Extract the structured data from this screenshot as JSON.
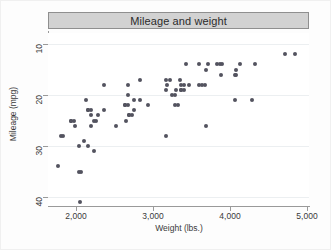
{
  "chart_data": {
    "type": "scatter",
    "title": "Mileage and weight",
    "xlabel": "Weight (lbs.)",
    "ylabel": "Mileage (mpg)",
    "xlim": [
      1700,
      5000
    ],
    "ylim": [
      10,
      42
    ],
    "xticks": [
      2000,
      3000,
      4000,
      5000
    ],
    "xtick_labels": [
      "2,000",
      "3,000",
      "4,000",
      "5,000"
    ],
    "yticks": [
      10,
      20,
      30,
      40
    ],
    "ytick_labels": [
      "10",
      "20",
      "30",
      "40"
    ],
    "grid": "horizontal",
    "legend": "none",
    "marker_color": "#53535f",
    "title_bar_color": "#d2d2d2",
    "points": [
      {
        "x": 2930,
        "y": 22
      },
      {
        "x": 3350,
        "y": 17
      },
      {
        "x": 2640,
        "y": 22
      },
      {
        "x": 3250,
        "y": 20
      },
      {
        "x": 4080,
        "y": 15
      },
      {
        "x": 3670,
        "y": 18
      },
      {
        "x": 3690,
        "y": 26
      },
      {
        "x": 3280,
        "y": 20
      },
      {
        "x": 3880,
        "y": 16
      },
      {
        "x": 3400,
        "y": 19
      },
      {
        "x": 4330,
        "y": 14
      },
      {
        "x": 3900,
        "y": 14
      },
      {
        "x": 4290,
        "y": 21
      },
      {
        "x": 3870,
        "y": 14
      },
      {
        "x": 2110,
        "y": 29
      },
      {
        "x": 2200,
        "y": 23
      },
      {
        "x": 2670,
        "y": 20
      },
      {
        "x": 3690,
        "y": 15
      },
      {
        "x": 3180,
        "y": 18
      },
      {
        "x": 3220,
        "y": 17
      },
      {
        "x": 4060,
        "y": 21
      },
      {
        "x": 3720,
        "y": 14
      },
      {
        "x": 3370,
        "y": 19
      },
      {
        "x": 3600,
        "y": 14
      },
      {
        "x": 4130,
        "y": 14
      },
      {
        "x": 2830,
        "y": 21
      },
      {
        "x": 3370,
        "y": 19
      },
      {
        "x": 4080,
        "y": 16
      },
      {
        "x": 4060,
        "y": 16
      },
      {
        "x": 3640,
        "y": 18
      },
      {
        "x": 2690,
        "y": 24
      },
      {
        "x": 3470,
        "y": 18
      },
      {
        "x": 3170,
        "y": 17
      },
      {
        "x": 3430,
        "y": 14
      },
      {
        "x": 4720,
        "y": 12
      },
      {
        "x": 3830,
        "y": 14
      },
      {
        "x": 4840,
        "y": 12
      },
      {
        "x": 3370,
        "y": 18
      },
      {
        "x": 2730,
        "y": 24
      },
      {
        "x": 2370,
        "y": 23
      },
      {
        "x": 2280,
        "y": 24
      },
      {
        "x": 2750,
        "y": 23
      },
      {
        "x": 2130,
        "y": 21
      },
      {
        "x": 2650,
        "y": 25
      },
      {
        "x": 3600,
        "y": 18
      },
      {
        "x": 3330,
        "y": 22
      },
      {
        "x": 2260,
        "y": 25
      },
      {
        "x": 1800,
        "y": 28
      },
      {
        "x": 2230,
        "y": 25
      },
      {
        "x": 1930,
        "y": 25
      },
      {
        "x": 1990,
        "y": 26
      },
      {
        "x": 2040,
        "y": 35
      },
      {
        "x": 2520,
        "y": 26
      },
      {
        "x": 3170,
        "y": 28
      },
      {
        "x": 2670,
        "y": 22
      },
      {
        "x": 1760,
        "y": 34
      },
      {
        "x": 2050,
        "y": 41
      },
      {
        "x": 1830,
        "y": 28
      },
      {
        "x": 2160,
        "y": 30
      },
      {
        "x": 2040,
        "y": 30
      },
      {
        "x": 2240,
        "y": 31
      },
      {
        "x": 2370,
        "y": 18
      },
      {
        "x": 2190,
        "y": 24
      },
      {
        "x": 2200,
        "y": 26
      },
      {
        "x": 2150,
        "y": 23
      },
      {
        "x": 2070,
        "y": 35
      },
      {
        "x": 1930,
        "y": 25
      },
      {
        "x": 1980,
        "y": 25
      },
      {
        "x": 2670,
        "y": 18
      },
      {
        "x": 2160,
        "y": 23
      },
      {
        "x": 2750,
        "y": 21
      },
      {
        "x": 2830,
        "y": 17
      },
      {
        "x": 3170,
        "y": 19
      },
      {
        "x": 2640,
        "y": 22
      },
      {
        "x": 3290,
        "y": 22
      },
      {
        "x": 2690,
        "y": 24
      },
      {
        "x": 3300,
        "y": 19
      },
      {
        "x": 3400,
        "y": 18
      }
    ]
  },
  "axis": {
    "ytick_positions": [
      42,
      94,
      145,
      197
    ],
    "xtick_positions": [
      75,
      152,
      229,
      306
    ]
  }
}
